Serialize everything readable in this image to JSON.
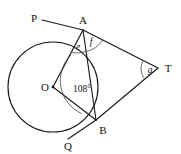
{
  "figure": {
    "kind": "circle-geometry-diagram",
    "background_color": "#ffffff",
    "line_color": "#1a1a1a",
    "points": {
      "P": {
        "label": "P",
        "x": 42,
        "y": 20,
        "label_x": 37,
        "label_y": 20
      },
      "A": {
        "label": "A",
        "x": 83,
        "y": 30,
        "label_x": 79,
        "label_y": 25
      },
      "T": {
        "label": "T",
        "x": 158,
        "y": 68,
        "label_x": 163,
        "label_y": 71
      },
      "O": {
        "label": "O",
        "x": 53,
        "y": 87,
        "label_x": 43,
        "label_y": 90
      },
      "B": {
        "label": "B",
        "x": 96,
        "y": 120,
        "label_x": 99,
        "label_y": 131
      },
      "Q": {
        "label": "Q",
        "x": 70,
        "y": 137,
        "label_x": 65,
        "label_y": 147
      }
    },
    "circle": {
      "center_x": 53,
      "center_y": 87,
      "radius": 45
    },
    "angles": {
      "centre_angle": {
        "name": "angle-AOB",
        "label": "108°",
        "vertex": "O",
        "label_x": 61,
        "label_y": 90
      },
      "angle_e": {
        "name": "angle-OAB",
        "label": "e",
        "vertex": "A",
        "label_x": 75,
        "label_y": 48
      },
      "angle_f": {
        "name": "angle-BAT",
        "label": "f",
        "vertex": "A",
        "label_x": 88,
        "label_y": 45
      },
      "angle_g": {
        "name": "angle-ATB",
        "label": "g",
        "vertex": "T",
        "label_x": 148,
        "label_y": 71
      }
    },
    "segments": [
      {
        "name": "line-P-to-A",
        "from": "P",
        "to": "A"
      },
      {
        "name": "line-A-to-T",
        "from": "A",
        "to": "T"
      },
      {
        "name": "line-A-to-O",
        "from": "A",
        "to": "O"
      },
      {
        "name": "line-A-to-B",
        "from": "A",
        "to": "B"
      },
      {
        "name": "line-O-to-B",
        "from": "O",
        "to": "B"
      },
      {
        "name": "line-B-to-T",
        "from": "B",
        "to": "T"
      },
      {
        "name": "line-B-to-Q",
        "from": "B",
        "to": "Q"
      }
    ]
  }
}
